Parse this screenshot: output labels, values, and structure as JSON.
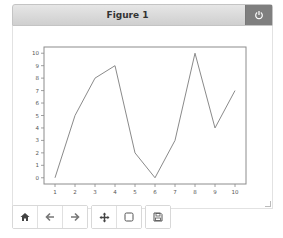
{
  "window": {
    "title": "Figure 1",
    "close_icon": "power-icon"
  },
  "toolbar": {
    "buttons": [
      {
        "name": "home",
        "icon": "home-icon"
      },
      {
        "name": "back",
        "icon": "arrow-left-icon"
      },
      {
        "name": "forward",
        "icon": "arrow-right-icon"
      },
      {
        "name": "pan",
        "icon": "move-icon"
      },
      {
        "name": "zoom",
        "icon": "zoom-rect-icon"
      },
      {
        "name": "save",
        "icon": "floppy-disk-icon"
      }
    ]
  },
  "chart_data": {
    "type": "line",
    "title": "",
    "xlabel": "",
    "ylabel": "",
    "x": [
      1,
      2,
      3,
      4,
      5,
      6,
      7,
      8,
      9,
      10
    ],
    "series": [
      {
        "name": "line",
        "values": [
          0,
          5,
          8,
          9,
          2,
          0,
          3,
          10,
          4,
          7
        ],
        "color": "#8a8a8a"
      }
    ],
    "xticks": [
      "1",
      "2",
      "3",
      "4",
      "5",
      "6",
      "7",
      "8",
      "9",
      "10"
    ],
    "yticks": [
      "0",
      "1",
      "2",
      "3",
      "4",
      "5",
      "6",
      "7",
      "8",
      "9",
      "10"
    ],
    "xlim": [
      0.45,
      10.55
    ],
    "ylim": [
      -0.5,
      10.5
    ],
    "grid": false,
    "legend": null
  }
}
